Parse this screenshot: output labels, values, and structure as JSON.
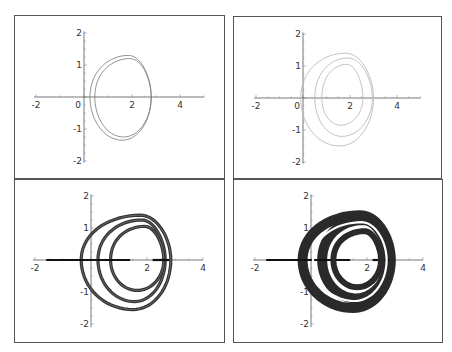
{
  "chart_data": [
    {
      "type": "line",
      "panel": "top-left",
      "title": "",
      "xlabel": "",
      "ylabel": "",
      "xlim": [
        -2,
        5
      ],
      "ylim": [
        -2,
        2
      ],
      "xticks": [
        -2,
        0,
        2,
        4
      ],
      "yticks": [
        -2,
        -1,
        0,
        1,
        2
      ],
      "xtick_labels": [
        "-2",
        "0",
        "2",
        "4"
      ],
      "ytick_labels": [
        "-2",
        "-1",
        "1",
        "2"
      ],
      "grid": false,
      "description": "Single closed orbit traced as a narrow double loop (period-2 limit cycle)",
      "series": [
        {
          "name": "orbit",
          "loops": [
            {
              "cx": 1.6,
              "cy": 0,
              "rx_left": 1.35,
              "rx_right": 1.2,
              "ry_top": 1.3,
              "ry_bot": 1.35
            },
            {
              "cx": 1.65,
              "cy": 0,
              "rx_left": 1.2,
              "rx_right": 1.15,
              "ry_top": 1.2,
              "ry_bot": 1.25
            }
          ]
        }
      ],
      "line_color": "#777777",
      "line_width": 0.8
    },
    {
      "type": "line",
      "panel": "top-right",
      "xlim": [
        -2,
        5
      ],
      "ylim": [
        -2,
        2
      ],
      "xticks": [
        -2,
        0,
        2,
        4
      ],
      "yticks": [
        -2,
        -1,
        0,
        1,
        2
      ],
      "xtick_labels": [
        "-2",
        "0",
        "2",
        "4"
      ],
      "ytick_labels": [
        "-2",
        "-1",
        "1",
        "2"
      ],
      "grid": false,
      "description": "Period-4 orbit: three nested loops, faint grey",
      "series": [
        {
          "name": "orbit",
          "loops": [
            {
              "cx": 1.55,
              "cy": 0,
              "rx_left": 1.65,
              "rx_right": 1.45,
              "ry_top": 1.4,
              "ry_bot": 1.5
            },
            {
              "cx": 1.65,
              "cy": 0,
              "rx_left": 1.15,
              "rx_right": 1.3,
              "ry_top": 1.25,
              "ry_bot": 1.2
            },
            {
              "cx": 1.6,
              "cy": 0,
              "rx_left": 0.8,
              "rx_right": 0.95,
              "ry_top": 1.05,
              "ry_bot": 0.85
            }
          ]
        }
      ],
      "line_color": "#bbbbbb",
      "line_width": 0.9
    },
    {
      "type": "line",
      "panel": "bottom-left",
      "xlim": [
        -2,
        4
      ],
      "ylim": [
        -2,
        2
      ],
      "xticks": [
        -2,
        2,
        4
      ],
      "yticks": [
        -2,
        -1,
        1,
        2
      ],
      "xtick_labels": [
        "-2",
        "2",
        "4"
      ],
      "ytick_labels": [
        "-2",
        "-1",
        "1",
        "2"
      ],
      "grid": false,
      "description": "Higher-period orbit: multiple thick nested bands plus thick segment on x-axis",
      "series": [
        {
          "name": "orbit",
          "loops": [
            {
              "cx": 1.5,
              "cy": 0,
              "rx_left": 1.85,
              "rx_right": 1.35,
              "ry_top": 1.4,
              "ry_bot": 1.55
            },
            {
              "cx": 1.55,
              "cy": 0,
              "rx_left": 1.3,
              "rx_right": 1.1,
              "ry_top": 1.25,
              "ry_bot": 1.3
            },
            {
              "cx": 1.65,
              "cy": 0,
              "rx_left": 0.95,
              "rx_right": 0.95,
              "ry_top": 1.05,
              "ry_bot": 0.95
            }
          ]
        },
        {
          "name": "axis-segment",
          "x_from": -1.6,
          "x_to": 1.4
        },
        {
          "name": "axis-segment-2",
          "x_from": 2.2,
          "x_to": 2.8
        }
      ],
      "line_color": "#333333",
      "line_width": 3.2
    },
    {
      "type": "line",
      "panel": "bottom-right",
      "xlim": [
        -2,
        4
      ],
      "ylim": [
        -2,
        2
      ],
      "xticks": [
        -2,
        2,
        4
      ],
      "yticks": [
        -2,
        -1,
        1,
        2
      ],
      "xtick_labels": [
        "-2",
        "2",
        "4"
      ],
      "ytick_labels": [
        "-2",
        "-1",
        "1",
        "2"
      ],
      "grid": false,
      "description": "Chaotic attractor: dense filled bands forming nested rings",
      "series": [
        {
          "name": "attractor",
          "loops": [
            {
              "cx": 1.5,
              "cy": 0,
              "rx_left": 1.8,
              "rx_right": 1.35,
              "ry_top": 1.4,
              "ry_bot": 1.5
            },
            {
              "cx": 1.6,
              "cy": 0,
              "rx_left": 1.2,
              "rx_right": 1.15,
              "ry_top": 1.25,
              "ry_bot": 1.2
            }
          ]
        },
        {
          "name": "axis-segment",
          "x_from": -1.6,
          "x_to": 1.4
        },
        {
          "name": "axis-segment-2",
          "x_from": 2.2,
          "x_to": 2.8
        }
      ],
      "line_color": "#2a2a2a",
      "line_width": 10
    }
  ],
  "panels": [
    {
      "id": "tl",
      "left": 14,
      "top": 15,
      "width": 211,
      "height": 164,
      "ox": 69,
      "oy": 81,
      "sx": 24,
      "sy": 32,
      "xmin": -2,
      "xmax": 5,
      "y_axis_min": -2.05,
      "y_axis_max": 2.05
    },
    {
      "id": "tr",
      "left": 233,
      "top": 16,
      "width": 209,
      "height": 163,
      "ox": 69,
      "oy": 81,
      "sx": 23.5,
      "sy": 32,
      "xmin": -2,
      "xmax": 5,
      "y_axis_min": -2.05,
      "y_axis_max": 2.05
    },
    {
      "id": "bl",
      "left": 14,
      "top": 179,
      "width": 211,
      "height": 164,
      "ox": 76,
      "oy": 80,
      "sx": 28,
      "sy": 32,
      "xmin": -2,
      "xmax": 4,
      "y_axis_min": -2.1,
      "y_axis_max": 2.05
    },
    {
      "id": "br",
      "left": 233,
      "top": 179,
      "width": 210,
      "height": 164,
      "ox": 77,
      "oy": 80,
      "sx": 28,
      "sy": 32,
      "xmin": -2,
      "xmax": 4,
      "y_axis_min": -2.1,
      "y_axis_max": 2.05
    }
  ]
}
